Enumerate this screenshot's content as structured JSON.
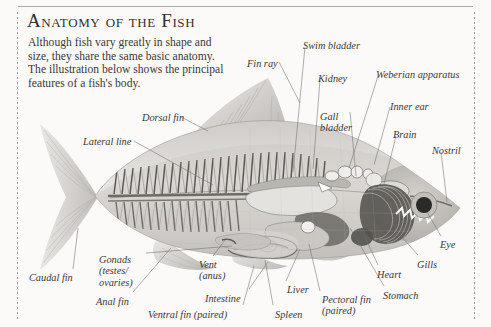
{
  "document": {
    "title": "Anatomy of the Fish",
    "intro": "Although fish vary greatly in shape and size, they share the same basic anatomy. The illustration below shows the principal features of a fish's body."
  },
  "colors": {
    "page_background": "#fbfaf8",
    "text": "#3a3836",
    "title": "#33312f",
    "rule": "#a9a9a3",
    "leader_line": "#6f6d6a",
    "fish_body_light": "#d9d7d3",
    "fish_body_mid": "#b5b2ae",
    "fish_body_dark": "#7d7a76",
    "organ_dark": "#54524f",
    "eye_pupil": "#2b2a28"
  },
  "labels": [
    {
      "id": "fin-ray",
      "text": "Fin ray",
      "x": 247,
      "y": 58,
      "lines": 1
    },
    {
      "id": "swim-bladder",
      "text": "Swim bladder",
      "x": 303,
      "y": 40,
      "lines": 1
    },
    {
      "id": "kidney",
      "text": "Kidney",
      "x": 318,
      "y": 73,
      "lines": 1
    },
    {
      "id": "weberian-apparatus",
      "text": "Weberian apparatus",
      "x": 376,
      "y": 69,
      "lines": 1
    },
    {
      "id": "gall-bladder",
      "text": "Gall\nbladder",
      "x": 320,
      "y": 111,
      "lines": 2
    },
    {
      "id": "inner-ear",
      "text": "Inner ear",
      "x": 390,
      "y": 101,
      "lines": 1
    },
    {
      "id": "brain",
      "text": "Brain",
      "x": 393,
      "y": 129,
      "lines": 1
    },
    {
      "id": "nostril",
      "text": "Nostril",
      "x": 432,
      "y": 145,
      "lines": 1
    },
    {
      "id": "dorsal-fin",
      "text": "Dorsal fin",
      "x": 142,
      "y": 112,
      "lines": 1
    },
    {
      "id": "lateral-line",
      "text": "Lateral line",
      "x": 83,
      "y": 136,
      "lines": 1
    },
    {
      "id": "eye",
      "text": "Eye",
      "x": 440,
      "y": 239,
      "lines": 1
    },
    {
      "id": "gills",
      "text": "Gills",
      "x": 417,
      "y": 259,
      "lines": 1
    },
    {
      "id": "heart",
      "text": "Heart",
      "x": 377,
      "y": 269,
      "lines": 1
    },
    {
      "id": "stomach",
      "text": "Stomach",
      "x": 383,
      "y": 290,
      "lines": 1
    },
    {
      "id": "pectoral-fin",
      "text": "Pectoral fin\n(paired)",
      "x": 322,
      "y": 294,
      "lines": 2
    },
    {
      "id": "spleen",
      "text": "Spleen",
      "x": 275,
      "y": 309,
      "lines": 1
    },
    {
      "id": "liver",
      "text": "Liver",
      "x": 287,
      "y": 284,
      "lines": 1
    },
    {
      "id": "intestine",
      "text": "Intestine",
      "x": 205,
      "y": 293,
      "lines": 1
    },
    {
      "id": "ventral-fin",
      "text": "Ventral fin (paired)",
      "x": 148,
      "y": 309,
      "lines": 1
    },
    {
      "id": "anal-fin",
      "text": "Anal fin",
      "x": 96,
      "y": 296,
      "lines": 1
    },
    {
      "id": "vent-anus",
      "text": "Vent\n(anus)",
      "x": 199,
      "y": 259,
      "lines": 2
    },
    {
      "id": "gonads",
      "text": "Gonads\n(testes/\novaries)",
      "x": 99,
      "y": 254,
      "lines": 3
    },
    {
      "id": "caudal-fin",
      "text": "Caudal fin",
      "x": 29,
      "y": 272,
      "lines": 1
    }
  ],
  "leaders": [
    {
      "id": "fin-ray",
      "x1": 279,
      "y1": 62,
      "x2": 300,
      "y2": 103
    },
    {
      "id": "swim-bladder",
      "x1": 305,
      "y1": 47,
      "x2": 293,
      "y2": 172
    },
    {
      "id": "kidney",
      "x1": 320,
      "y1": 80,
      "x2": 313,
      "y2": 169
    },
    {
      "id": "weberian-apparatus",
      "x1": 378,
      "y1": 76,
      "x2": 349,
      "y2": 168
    },
    {
      "id": "gall-bladder",
      "x1": 350,
      "y1": 112,
      "x2": 356,
      "y2": 176
    },
    {
      "id": "inner-ear",
      "x1": 390,
      "y1": 107,
      "x2": 374,
      "y2": 165
    },
    {
      "id": "brain",
      "x1": 396,
      "y1": 136,
      "x2": 384,
      "y2": 184
    },
    {
      "id": "nostril",
      "x1": 441,
      "y1": 152,
      "x2": 447,
      "y2": 202
    },
    {
      "id": "dorsal-fin",
      "x1": 181,
      "y1": 117,
      "x2": 208,
      "y2": 131
    },
    {
      "id": "lateral-line",
      "x1": 134,
      "y1": 141,
      "x2": 213,
      "y2": 185
    },
    {
      "id": "eye",
      "x1": 441,
      "y1": 236,
      "x2": 427,
      "y2": 212
    },
    {
      "id": "gills",
      "x1": 418,
      "y1": 255,
      "x2": 400,
      "y2": 235
    },
    {
      "id": "heart",
      "x1": 378,
      "y1": 265,
      "x2": 364,
      "y2": 235
    },
    {
      "id": "stomach",
      "x1": 384,
      "y1": 286,
      "x2": 350,
      "y2": 228
    },
    {
      "id": "pectoral-fin",
      "x1": 320,
      "y1": 291,
      "x2": 309,
      "y2": 244
    },
    {
      "id": "spleen",
      "x1": 273,
      "y1": 305,
      "x2": 265,
      "y2": 260
    },
    {
      "id": "liver",
      "x1": 286,
      "y1": 281,
      "x2": 300,
      "y2": 249
    },
    {
      "id": "intestine",
      "x1": 249,
      "y1": 289,
      "x2": 268,
      "y2": 262
    },
    {
      "id": "ventral-fin",
      "x1": 243,
      "y1": 305,
      "x2": 254,
      "y2": 266
    },
    {
      "id": "anal-fin",
      "x1": 133,
      "y1": 292,
      "x2": 171,
      "y2": 248
    },
    {
      "id": "vent-anus",
      "x1": 213,
      "y1": 256,
      "x2": 225,
      "y2": 240
    },
    {
      "id": "gonads",
      "x1": 146,
      "y1": 253,
      "x2": 232,
      "y2": 246
    },
    {
      "id": "caudal-fin",
      "x1": 73,
      "y1": 269,
      "x2": 78,
      "y2": 228
    }
  ]
}
